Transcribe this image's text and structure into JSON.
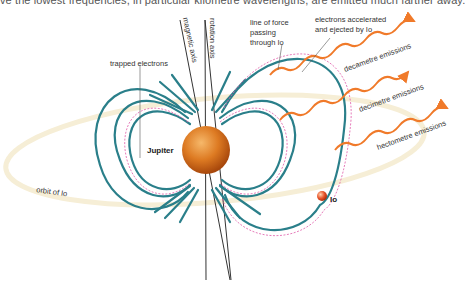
{
  "caption": "ve the lowest frequencies, in particular kilometre wavelengths, are emitted much farther away.",
  "labels": {
    "trapped_electrons": "trapped electrons",
    "magnetic_axis": "magnetic axis",
    "rotation_axis": "rotation axis",
    "line_of_force_1": "line of force",
    "line_of_force_2": "passing",
    "line_of_force_3": "through Io",
    "electrons_1": "electrons accelerated",
    "electrons_2": "and ejected by Io",
    "decametre": "decametre emissions",
    "decimetre": "decimetre emissions",
    "hectometre": "hectometre emissions",
    "jupiter": "Jupiter",
    "io": "Io",
    "orbit": "orbit of Io"
  },
  "colors": {
    "field_lines": "#2a7f8a",
    "trapped": "#e05aa8",
    "emission": "#f07a2a",
    "orbit": "#f5ecd0",
    "jupiter": "#d9701e"
  }
}
